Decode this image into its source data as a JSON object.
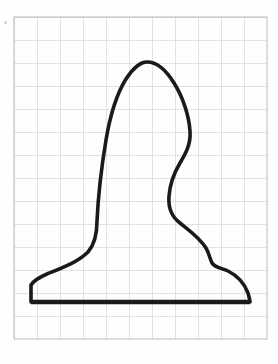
{
  "scene": {
    "title": "Hand-drawn silhouette outline on graph paper",
    "canvas_width": 278,
    "canvas_height": 364,
    "background_color": "#fefefe",
    "description": "A closed freehand contour resembling a bust or chess-piece profile, drawn in heavy black ink over a faint grey square grid, resting on a thick horizontal baseline."
  },
  "grid": {
    "name": "graph-paper-grid",
    "origin_x": 14,
    "origin_y": 17,
    "cell_size": 23,
    "columns": 11,
    "rows": 14,
    "width": 253,
    "height": 322,
    "line_color": "#bfc2c6",
    "line_width": 0.9,
    "border_color": "#b3b6ba"
  },
  "outline": {
    "name": "silhouette-outline",
    "stroke_color": "#1a1a1a",
    "stroke_width": 3.6,
    "fill": "none",
    "closed": true,
    "path": "M 31 302 L 31 285 C 34 280 40 277 47 274 C 62 268 78 262 88 252 C 95 244 97 232 97 221 C 98 200 101 170 106 140 C 110 116 116 95 126 79 C 133 68 141 62 147 62 C 156 62 166 70 174 83 C 183 97 189 116 190 131 C 191 144 186 153 180 163 C 174 173 170 184 169 196 C 168 208 172 217 180 223 C 190 231 200 238 206 248 C 209 253 210 259 212 263 C 215 268 222 268 228 271 C 238 276 245 285 248 293 C 249 297 250 300 250 302 Z"
  },
  "baseline": {
    "name": "figure-baseline",
    "stroke_color": "#1a1a1a",
    "stroke_width": 4.6,
    "x1": 31,
    "y1": 302,
    "x2": 250,
    "y2": 302
  },
  "marks": [
    {
      "name": "left-margin-dot",
      "x": 4,
      "y": 21,
      "color": "#cfcfcf",
      "label": ""
    }
  ]
}
